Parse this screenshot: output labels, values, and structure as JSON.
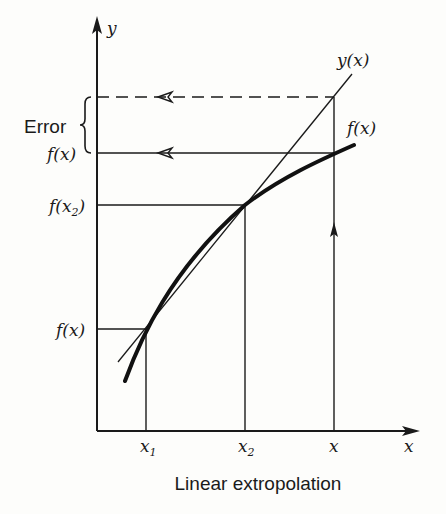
{
  "diagram": {
    "caption": "Linear extropolation",
    "axes": {
      "y_label": "y",
      "x_label": "x"
    },
    "x_ticks": [
      {
        "name": "x",
        "sub": "1"
      },
      {
        "name": "x",
        "sub": "2"
      },
      {
        "name": "x",
        "sub": ""
      }
    ],
    "y_labels": {
      "f_x_top": "f(x)",
      "f_x2_fn": "f(x",
      "f_x2_sub": "2",
      "f_x2_close": ")",
      "f_x_bottom": "f(x)"
    },
    "curve_labels": {
      "line": "y(x)",
      "curve": "f(x)"
    },
    "error_label": "Error",
    "colors": {
      "ink": "#1a1a1a",
      "background": "#fdfdfb"
    }
  }
}
